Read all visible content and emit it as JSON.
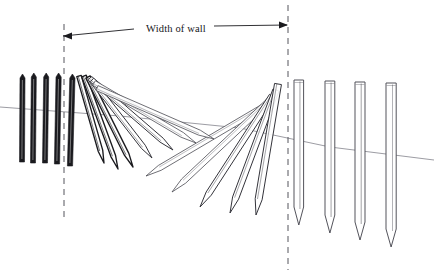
{
  "figure": {
    "background_color": "#ffffff",
    "ink_color": "#1a1a1e",
    "outline_color": "#4a4a52",
    "faint_line_color": "#8a8a92",
    "width": 434,
    "height": 275
  },
  "annotations": {
    "dimension_label": "Width of wall",
    "dimension_label_x": 176,
    "dimension_label_y": 32,
    "leader_left": {
      "x1": 63,
      "y1": 36,
      "x2": 134,
      "y2": 29
    },
    "leader_right": {
      "x1": 214,
      "y1": 26,
      "x2": 287,
      "y2": 25
    },
    "arrow_left": {
      "x": 63,
      "y": 36
    },
    "arrow_right": {
      "x": 288,
      "y": 25
    }
  },
  "reference_lines": {
    "left_dashed": {
      "x": 64,
      "y1": 24,
      "y2": 222
    },
    "right_dashed": {
      "x": 288,
      "y1": 5,
      "y2": 270
    }
  },
  "ground_line": {
    "points": "0,107 120,116 240,128 330,147 434,160"
  },
  "standing_stakes_left": {
    "fill_style": "inked",
    "items": [
      {
        "x": 22,
        "top": 74,
        "bottom": 162,
        "width": 5.0,
        "tilt": 0.5
      },
      {
        "x": 33,
        "top": 73,
        "bottom": 163,
        "width": 5.0,
        "tilt": 0.8
      },
      {
        "x": 45,
        "top": 73,
        "bottom": 163,
        "width": 5.0,
        "tilt": 1.2
      },
      {
        "x": 57,
        "top": 73,
        "bottom": 164,
        "width": 5.2,
        "tilt": 1.6
      },
      {
        "x": 70,
        "top": 74,
        "bottom": 166,
        "width": 5.2,
        "tilt": 2.4
      }
    ]
  },
  "falling_planks": {
    "description": "Planks tilting progressively, tops hinged near the left, tips sweeping right and down into a catenary sag",
    "items": [
      {
        "hinge_x": 79,
        "hinge_y": 76,
        "tip_x": 104,
        "tip_y": 163,
        "width": 4.6,
        "shade": "dark"
      },
      {
        "hinge_x": 84,
        "hinge_y": 76,
        "tip_x": 118,
        "tip_y": 169,
        "width": 4.8,
        "shade": "dark"
      },
      {
        "hinge_x": 88,
        "hinge_y": 77,
        "tip_x": 133,
        "tip_y": 167,
        "width": 4.8,
        "shade": "dark"
      },
      {
        "hinge_x": 90,
        "hinge_y": 78,
        "tip_x": 152,
        "tip_y": 158,
        "width": 5.0,
        "shade": "mid"
      },
      {
        "hinge_x": 92,
        "hinge_y": 80,
        "tip_x": 173,
        "tip_y": 150,
        "width": 5.0,
        "shade": "mid"
      },
      {
        "hinge_x": 94,
        "hinge_y": 83,
        "tip_x": 196,
        "tip_y": 143,
        "width": 5.2,
        "shade": "light"
      },
      {
        "hinge_x": 97,
        "hinge_y": 88,
        "tip_x": 214,
        "tip_y": 139,
        "width": 5.2,
        "shade": "light"
      }
    ]
  },
  "fallen_planks_right": {
    "description": "Planks lying low and leaning back toward the left, tips pointing down-left",
    "items": [
      {
        "hinge_x": 268,
        "hinge_y": 104,
        "tip_x": 146,
        "tip_y": 176,
        "width": 5.6,
        "shade": "light"
      },
      {
        "hinge_x": 270,
        "hinge_y": 100,
        "tip_x": 172,
        "tip_y": 192,
        "width": 5.8,
        "shade": "light"
      },
      {
        "hinge_x": 272,
        "hinge_y": 96,
        "tip_x": 200,
        "tip_y": 207,
        "width": 6.0,
        "shade": "mid"
      },
      {
        "hinge_x": 276,
        "hinge_y": 90,
        "tip_x": 230,
        "tip_y": 213,
        "width": 6.4,
        "shade": "mid"
      },
      {
        "hinge_x": 278,
        "hinge_y": 84,
        "tip_x": 256,
        "tip_y": 215,
        "width": 7.0,
        "shade": "mid"
      }
    ]
  },
  "standing_stakes_right": {
    "fill_style": "outlined",
    "items": [
      {
        "x": 294,
        "top": 80,
        "bottom": 225,
        "width": 9.6
      },
      {
        "x": 325,
        "top": 81,
        "bottom": 233,
        "width": 9.8
      },
      {
        "x": 355,
        "top": 82,
        "bottom": 240,
        "width": 10.0
      },
      {
        "x": 386,
        "top": 83,
        "bottom": 247,
        "width": 10.2
      }
    ]
  }
}
